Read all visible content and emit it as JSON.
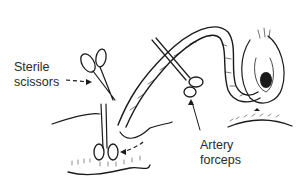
{
  "figure": {
    "labels": {
      "scissors_line1": "Sterile",
      "scissors_line2": "scissors",
      "forceps_line1": "Artery",
      "forceps_line2": "forceps"
    },
    "colors": {
      "ink": "#1a1a1a",
      "text": "#2a2a2a",
      "background": "#ffffff"
    }
  }
}
